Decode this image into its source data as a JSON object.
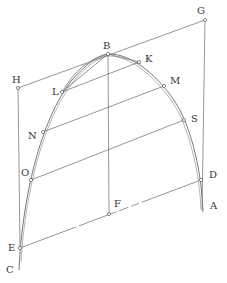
{
  "diagram": {
    "type": "geometric-construction",
    "colors": {
      "line": "#7a7a7a",
      "curve": "#6a6a6a",
      "text": "#333333",
      "background": "#ffffff"
    },
    "points": {
      "A": {
        "label": "A",
        "x": 202,
        "y": 210,
        "lx": 210,
        "ly": 209
      },
      "B": {
        "label": "B",
        "x": 108,
        "y": 54,
        "lx": 103,
        "ly": 49
      },
      "C": {
        "label": "C",
        "x": 19,
        "y": 268,
        "lx": 6,
        "ly": 273
      },
      "D": {
        "label": "D",
        "x": 201,
        "y": 180,
        "lx": 209,
        "ly": 178
      },
      "E": {
        "label": "E",
        "x": 20,
        "y": 248,
        "lx": 8,
        "ly": 251
      },
      "F": {
        "label": "F",
        "x": 109,
        "y": 214,
        "lx": 114,
        "ly": 207
      },
      "G": {
        "label": "G",
        "x": 205,
        "y": 20,
        "lx": 197,
        "ly": 14
      },
      "H": {
        "label": "H",
        "x": 18,
        "y": 88,
        "lx": 12,
        "ly": 83
      },
      "K": {
        "label": "K",
        "x": 139,
        "y": 62,
        "lx": 145,
        "ly": 62
      },
      "L": {
        "label": "L",
        "x": 62,
        "y": 92,
        "lx": 52,
        "ly": 95
      },
      "M": {
        "label": "M",
        "x": 164,
        "y": 86,
        "lx": 170,
        "ly": 84
      },
      "N": {
        "label": "N",
        "x": 43,
        "y": 132,
        "lx": 28,
        "ly": 139
      },
      "O": {
        "label": "O",
        "x": 31,
        "y": 180,
        "lx": 21,
        "ly": 176
      },
      "S": {
        "label": "S",
        "x": 184,
        "y": 120,
        "lx": 191,
        "ly": 122
      }
    },
    "labels": [
      "A",
      "B",
      "C",
      "D",
      "E",
      "F",
      "G",
      "H",
      "K",
      "L",
      "M",
      "N",
      "O",
      "S"
    ]
  }
}
